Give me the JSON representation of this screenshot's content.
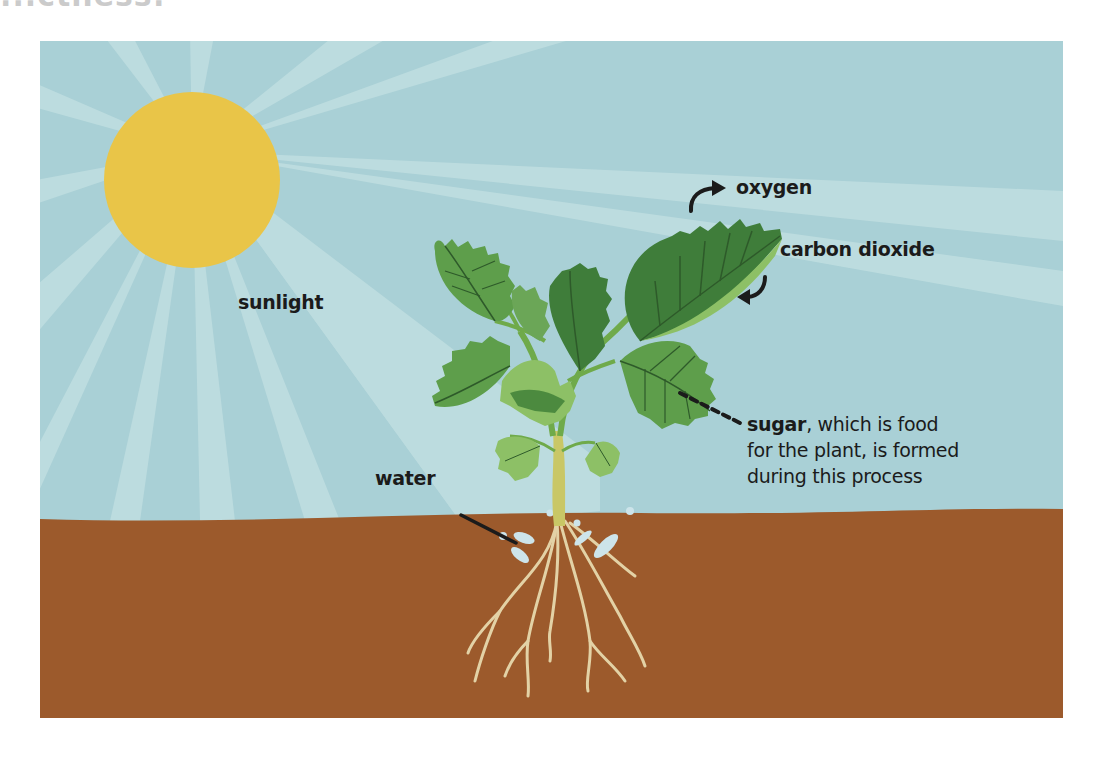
{
  "page": {
    "cropped_heading": "...ctness:"
  },
  "diagram": {
    "labels": {
      "sunlight": "sunlight",
      "oxygen": "oxygen",
      "carbon_dioxide": "carbon dioxide",
      "water": "water",
      "sugar_bold": "sugar",
      "sugar_rest_line1": ", which is food",
      "sugar_rest_line2": "for the plant, is formed",
      "sugar_rest_line3": "during this process"
    },
    "elements": {
      "sun": "sun-icon",
      "plant": "plant-icon",
      "roots": "roots-icon",
      "water_drops": "water-drop-icon",
      "oxygen_arrow": "curved-arrow-out-icon",
      "co2_arrow": "curved-arrow-in-icon",
      "sugar_pointer": "dashed-leader-line",
      "water_pointer": "solid-leader-line"
    },
    "colors": {
      "sky": "#A9D0D6",
      "sky_ray": "#C3E0E2",
      "sun": "#E9C548",
      "soil": "#9C5A2C",
      "leaf_dark": "#3F7D3A",
      "leaf_mid": "#5E9E4B",
      "leaf_light": "#8DC066",
      "vein": "#2E5A2A",
      "stem": "#6FAA4A",
      "stem_base": "#C9C766",
      "root": "#E3D2A6",
      "water": "#CDE4EA",
      "text": "#1B1B1B"
    }
  }
}
